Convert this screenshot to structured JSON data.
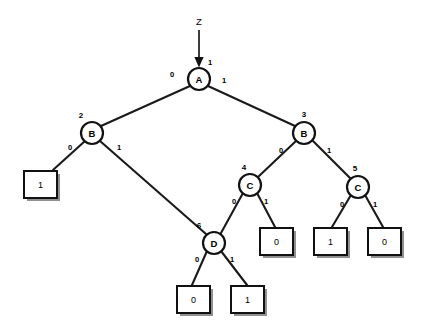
{
  "diagram": {
    "kind": "binary-decision-diagram",
    "background_color": "#ffffff",
    "line_color": "#111111",
    "shadow_color": "#7d7d7d",
    "root_input": {
      "label": "Z",
      "edge_label": "1",
      "label_x": 199,
      "label_y": 21,
      "arrow_from_y": 30,
      "arrow_to_y": 66,
      "arrow_x": 199,
      "edge_label_x": 210,
      "edge_label_y": 62
    },
    "nodes": [
      {
        "id": "A",
        "label": "A",
        "index": "1",
        "cx": 199,
        "cy": 79,
        "r": 11,
        "index_x": 199,
        "index_y": 62,
        "index_hidden": true
      },
      {
        "id": "B1",
        "label": "B",
        "index": "2",
        "cx": 92,
        "cy": 133,
        "r": 11,
        "index_x": 81,
        "index_y": 115
      },
      {
        "id": "B2",
        "label": "B",
        "index": "3",
        "cx": 304,
        "cy": 133,
        "r": 11,
        "index_x": 304,
        "index_y": 114
      },
      {
        "id": "C1",
        "label": "C",
        "index": "4",
        "cx": 250,
        "cy": 185,
        "r": 11,
        "index_x": 244,
        "index_y": 167
      },
      {
        "id": "C2",
        "label": "C",
        "index": "5",
        "cx": 358,
        "cy": 187,
        "r": 11,
        "index_x": 355,
        "index_y": 168
      },
      {
        "id": "D",
        "label": "D",
        "index": "6",
        "cx": 214,
        "cy": 243,
        "r": 11,
        "index_x": 199,
        "index_y": 225
      }
    ],
    "terminals": [
      {
        "id": "T1",
        "label": "1",
        "x": 24,
        "y": 171,
        "w": 33,
        "h": 27
      },
      {
        "id": "T2",
        "label": "0",
        "x": 260,
        "y": 228,
        "w": 33,
        "h": 27
      },
      {
        "id": "T3",
        "label": "1",
        "x": 314,
        "y": 228,
        "w": 33,
        "h": 27
      },
      {
        "id": "T4",
        "label": "0",
        "x": 368,
        "y": 228,
        "w": 33,
        "h": 27
      },
      {
        "id": "T5",
        "label": "0",
        "x": 177,
        "y": 286,
        "w": 33,
        "h": 27
      },
      {
        "id": "T6",
        "label": "1",
        "x": 231,
        "y": 286,
        "w": 33,
        "h": 27
      }
    ],
    "edges": [
      {
        "from": "A",
        "to": "B1",
        "value": "0",
        "x1": 190,
        "y1": 86,
        "x2": 101,
        "y2": 126,
        "label_x": 172,
        "label_y": 74
      },
      {
        "from": "A",
        "to": "B2",
        "value": "1",
        "x1": 208,
        "y1": 86,
        "x2": 295,
        "y2": 126,
        "label_x": 224,
        "label_y": 80
      },
      {
        "from": "B1",
        "to": "T1",
        "value": "0",
        "x1": 85,
        "y1": 141,
        "x2": 53,
        "y2": 170,
        "label_x": 70,
        "label_y": 147
      },
      {
        "from": "B1",
        "to": "D",
        "value": "1",
        "x1": 100,
        "y1": 141,
        "x2": 206,
        "y2": 234,
        "label_x": 119,
        "label_y": 147
      },
      {
        "from": "B2",
        "to": "C1",
        "value": "0",
        "x1": 296,
        "y1": 141,
        "x2": 258,
        "y2": 177,
        "label_x": 281,
        "label_y": 150
      },
      {
        "from": "B2",
        "to": "C2",
        "value": "1",
        "x1": 313,
        "y1": 141,
        "x2": 351,
        "y2": 179,
        "label_x": 329,
        "label_y": 150
      },
      {
        "from": "C1",
        "to": "D",
        "value": "0",
        "x1": 243,
        "y1": 193,
        "x2": 221,
        "y2": 233,
        "label_x": 234,
        "label_y": 201
      },
      {
        "from": "C1",
        "to": "T2",
        "value": "1",
        "x1": 257,
        "y1": 193,
        "x2": 275,
        "y2": 227,
        "label_x": 266,
        "label_y": 201
      },
      {
        "from": "C2",
        "to": "T3",
        "value": "0",
        "x1": 351,
        "y1": 195,
        "x2": 332,
        "y2": 227,
        "label_x": 342,
        "label_y": 204
      },
      {
        "from": "C2",
        "to": "T4",
        "value": "1",
        "x1": 365,
        "y1": 195,
        "x2": 383,
        "y2": 227,
        "label_x": 375,
        "label_y": 204
      },
      {
        "from": "D",
        "to": "T5",
        "value": "0",
        "x1": 207,
        "y1": 251,
        "x2": 192,
        "y2": 285,
        "label_x": 197,
        "label_y": 259
      },
      {
        "from": "D",
        "to": "T6",
        "value": "1",
        "x1": 221,
        "y1": 251,
        "x2": 247,
        "y2": 285,
        "label_x": 232,
        "label_y": 259
      }
    ]
  }
}
